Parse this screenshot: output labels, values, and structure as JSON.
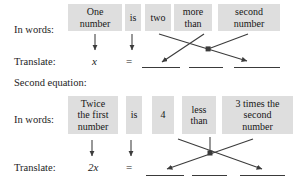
{
  "figure": {
    "title_text": "Translating words into equations",
    "row_label_in_words": "In words:",
    "row_label_translate": "Translate:",
    "section_heading": "Second equation:"
  },
  "equation_one": {
    "in_words_label": "In words:",
    "translate_label": "Translate:",
    "phrases": [
      {
        "id": "one-number",
        "lines": [
          "One",
          "number"
        ]
      },
      {
        "id": "is",
        "lines": [
          "is"
        ]
      },
      {
        "id": "two",
        "lines": [
          "two"
        ]
      },
      {
        "id": "more-than",
        "lines": [
          "more",
          "than"
        ]
      },
      {
        "id": "second-number",
        "lines": [
          "second",
          "number"
        ]
      }
    ],
    "translate_tokens": [
      {
        "id": "x",
        "text": "x",
        "italic": true
      },
      {
        "id": "equals",
        "text": "=",
        "italic": false
      }
    ],
    "blanks": [
      {
        "id": "blank-1"
      },
      {
        "id": "blank-2"
      },
      {
        "id": "blank-3"
      }
    ]
  },
  "equation_two": {
    "heading": "Second equation:",
    "in_words_label": "In words:",
    "translate_label": "Translate:",
    "phrases": [
      {
        "id": "twice-the-first-number",
        "lines": [
          "Twice",
          "the first",
          "number"
        ]
      },
      {
        "id": "is",
        "lines": [
          "is"
        ]
      },
      {
        "id": "four",
        "lines": [
          "4"
        ]
      },
      {
        "id": "less-than",
        "lines": [
          "less",
          "than"
        ]
      },
      {
        "id": "three-times-the-second-number",
        "lines": [
          "3 times the",
          "second",
          "number"
        ]
      }
    ],
    "translate_tokens": [
      {
        "id": "two-x",
        "text": "2x",
        "italic": true
      },
      {
        "id": "equals",
        "text": "=",
        "italic": false
      }
    ],
    "blanks": [
      {
        "id": "blank-1"
      },
      {
        "id": "blank-2"
      },
      {
        "id": "blank-3"
      }
    ]
  },
  "colors": {
    "phrase_background": "#dedede",
    "text": "#1a1a1a",
    "arrow": "#3b3b3b",
    "blank_line": "#3a3a3a",
    "page_background": "#ffffff"
  }
}
